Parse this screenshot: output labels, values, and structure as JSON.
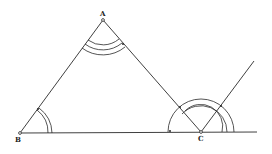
{
  "diagram": {
    "type": "geometry-construction",
    "points": {
      "A": {
        "label": "A",
        "x": 103,
        "y": 20
      },
      "B": {
        "label": "B",
        "x": 20,
        "y": 133
      },
      "C": {
        "label": "C",
        "x": 201,
        "y": 132
      }
    },
    "segments": [
      {
        "from": "A",
        "to": "B"
      },
      {
        "from": "A",
        "to": "C"
      },
      {
        "from": "B",
        "to": "extension",
        "note": "baseline through C extended to the right"
      },
      {
        "from": "C",
        "to": "ray-end",
        "note": "ray from C parallel to BA"
      }
    ],
    "angle_marks": [
      {
        "vertex": "A",
        "arcs": 3
      },
      {
        "vertex": "B",
        "arcs": 2
      },
      {
        "vertex": "C",
        "arcs": 3,
        "note": "exterior angle split into arcs"
      }
    ],
    "colors": {
      "stroke": "#2a2a2a",
      "background": "#ffffff"
    }
  }
}
